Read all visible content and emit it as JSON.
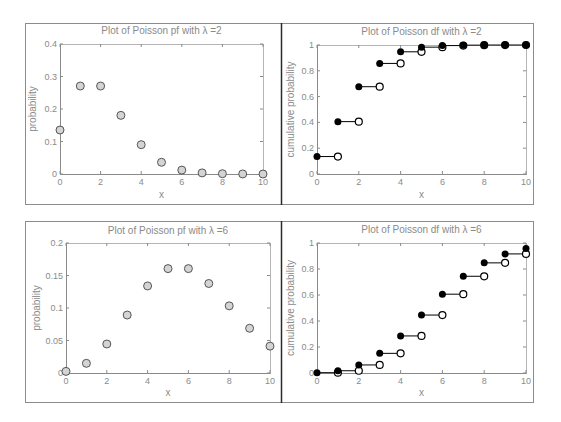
{
  "figure": {
    "colors": {
      "frame": "#8c8c8c",
      "divider": "#2a2a2a",
      "axis": "#8a8a8a",
      "text": "#8a8a8a",
      "marker_gray_fill": "#d4d4d4",
      "marker_edge": "#555555",
      "filled_marker": "#000000",
      "open_marker_fill": "#ffffff"
    }
  },
  "chart_data": [
    {
      "id": "pf_lambda2",
      "type": "scatter",
      "title": "Plot of Poisson pf with λ =2",
      "xlabel": "x",
      "ylabel": "probability",
      "xlim": [
        0,
        10
      ],
      "ylim": [
        0,
        0.4
      ],
      "xticks": [
        "0",
        "2",
        "4",
        "6",
        "8",
        "10"
      ],
      "yticks": [
        "0",
        "0.1",
        "0.2",
        "0.3",
        "0.4"
      ],
      "grid": false,
      "legend": null,
      "x": [
        0,
        1,
        2,
        3,
        4,
        5,
        6,
        7,
        8,
        9,
        10
      ],
      "values": [
        0.1353,
        0.2707,
        0.2707,
        0.1804,
        0.0902,
        0.0361,
        0.012,
        0.0034,
        0.0009,
        0.0002,
        0.0
      ],
      "marker": "gray-circle"
    },
    {
      "id": "df_lambda2",
      "type": "line",
      "style": "step",
      "title": "Plot of Poisson df with λ =2",
      "xlabel": "x",
      "ylabel": "cumulative probability",
      "xlim": [
        0,
        10
      ],
      "ylim": [
        0,
        1
      ],
      "xticks": [
        "0",
        "2",
        "4",
        "6",
        "8",
        "10"
      ],
      "yticks": [
        "0",
        "0.2",
        "0.4",
        "0.6",
        "0.8",
        "1"
      ],
      "grid": false,
      "legend": null,
      "x": [
        0,
        1,
        2,
        3,
        4,
        5,
        6,
        7,
        8,
        9,
        10
      ],
      "values": [
        0.1353,
        0.406,
        0.6767,
        0.8571,
        0.9473,
        0.9834,
        0.9955,
        0.9989,
        0.9998,
        1.0,
        1.0
      ],
      "marker": "filled-left-open-right"
    },
    {
      "id": "pf_lambda6",
      "type": "scatter",
      "title": "Plot of Poisson pf with λ =6",
      "xlabel": "x",
      "ylabel": "probability",
      "xlim": [
        0,
        10
      ],
      "ylim": [
        0,
        0.2
      ],
      "xticks": [
        "0",
        "2",
        "4",
        "6",
        "8",
        "10"
      ],
      "yticks": [
        "0",
        "0.05",
        "0.1",
        "0.15",
        "0.2"
      ],
      "grid": false,
      "legend": null,
      "x": [
        0,
        1,
        2,
        3,
        4,
        5,
        6,
        7,
        8,
        9,
        10
      ],
      "values": [
        0.0025,
        0.0149,
        0.0446,
        0.0892,
        0.1339,
        0.1606,
        0.1606,
        0.1377,
        0.1033,
        0.0688,
        0.0413
      ],
      "marker": "gray-circle"
    },
    {
      "id": "df_lambda6",
      "type": "line",
      "style": "step",
      "title": "Plot of Poisson df with λ =6",
      "xlabel": "x",
      "ylabel": "cumulative probability",
      "xlim": [
        0,
        10
      ],
      "ylim": [
        0,
        1
      ],
      "xticks": [
        "0",
        "2",
        "4",
        "6",
        "8",
        "10"
      ],
      "yticks": [
        "0",
        "0.2",
        "0.4",
        "0.6",
        "0.8",
        "1"
      ],
      "grid": false,
      "legend": null,
      "x": [
        0,
        1,
        2,
        3,
        4,
        5,
        6,
        7,
        8,
        9,
        10
      ],
      "values": [
        0.0025,
        0.0174,
        0.062,
        0.1512,
        0.2851,
        0.4457,
        0.6063,
        0.744,
        0.8472,
        0.9161,
        0.9574
      ],
      "marker": "filled-left-open-right"
    }
  ]
}
